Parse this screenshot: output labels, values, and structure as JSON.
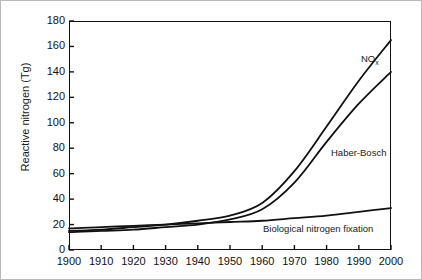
{
  "chart_data": {
    "type": "line",
    "title": "",
    "xlabel": "",
    "ylabel": "Reactive nitrogen (Tg)",
    "xlim": [
      1900,
      2000
    ],
    "ylim": [
      0,
      180
    ],
    "grid": false,
    "legend_position": "inline-annotations",
    "x": [
      1900,
      1910,
      1920,
      1930,
      1940,
      1950,
      1960,
      1970,
      1980,
      1990,
      2000
    ],
    "xticklabels": [
      "1900",
      "1910",
      "1920",
      "1930",
      "1940",
      "1950",
      "1960",
      "1970",
      "1980",
      "1990",
      "2000"
    ],
    "yticklabels": [
      "0",
      "20",
      "40",
      "60",
      "80",
      "100",
      "120",
      "140",
      "160",
      "180"
    ],
    "yticks": [
      0,
      20,
      40,
      60,
      80,
      100,
      120,
      140,
      160,
      180
    ],
    "series": [
      {
        "name": "NOx",
        "label": "NO",
        "label_sub": "x",
        "color": "#111111",
        "values": [
          15,
          16,
          18,
          20,
          23,
          27,
          37,
          62,
          97,
          133,
          165
        ]
      },
      {
        "name": "Haber-Bosch",
        "label": "Haber-Bosch",
        "label_sub": "",
        "color": "#111111",
        "values": [
          14,
          15,
          16,
          18,
          20,
          24,
          32,
          53,
          85,
          115,
          140
        ]
      },
      {
        "name": "Biological nitrogen fixation",
        "label": "Biological nitrogen fixation",
        "label_sub": "",
        "color": "#111111",
        "values": [
          17,
          18,
          19,
          20,
          21,
          22,
          23,
          25,
          27,
          30,
          33
        ]
      }
    ],
    "annotations": [
      {
        "text": "NOx",
        "series": "NOx"
      },
      {
        "text": "Haber-Bosch",
        "series": "Haber-Bosch"
      },
      {
        "text": "Biological nitrogen fixation",
        "series": "Biological nitrogen fixation"
      }
    ]
  }
}
